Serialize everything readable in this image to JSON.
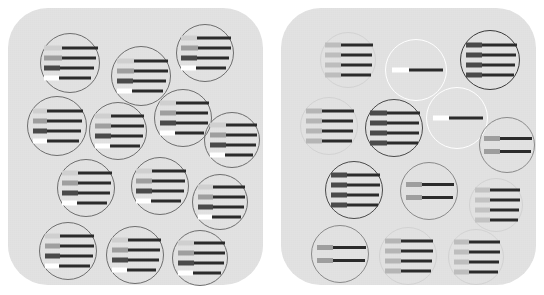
{
  "figure": {
    "background_color": "#ffffff",
    "panel_color": "#e2e2e2",
    "panel_corner_radius_px": 40
  },
  "palette": {
    "light_gray": "#cfcfcf",
    "mid_gray": "#9e9e9e",
    "dark_gray": "#4a4a4a",
    "white": "#ffffff",
    "bar_dark": "#2b2b2b",
    "circle_stroke_default": "#6e6e6e",
    "circle_stroke_white": "#ffffff"
  },
  "panels": [
    {
      "id": "panel-left",
      "name": "left-panel",
      "label": "",
      "cells": [
        {
          "id": "L1",
          "cx": 62,
          "cy": 55,
          "r": 30,
          "stroke": "#6e6e6e",
          "stroke_w": 1.1,
          "opacity": 1,
          "bars": [
            {
              "left": "#cfcfcf",
              "lw": 18,
              "rw": 36
            },
            {
              "left": "#9e9e9e",
              "lw": 18,
              "rw": 34
            },
            {
              "left": "#4a4a4a",
              "lw": 16,
              "rw": 34
            },
            {
              "left": "#ffffff",
              "lw": 15,
              "rw": 32
            }
          ]
        },
        {
          "id": "L2",
          "cx": 133,
          "cy": 68,
          "r": 30,
          "stroke": "#6e6e6e",
          "stroke_w": 1.1,
          "opacity": 1,
          "bars": [
            {
              "left": "#cfcfcf",
              "lw": 17,
              "rw": 34
            },
            {
              "left": "#9e9e9e",
              "lw": 17,
              "rw": 34
            },
            {
              "left": "#4a4a4a",
              "lw": 16,
              "rw": 33
            },
            {
              "left": "#ffffff",
              "lw": 15,
              "rw": 31
            }
          ]
        },
        {
          "id": "L3",
          "cx": 197,
          "cy": 45,
          "r": 29,
          "stroke": "#6e6e6e",
          "stroke_w": 1.1,
          "opacity": 1,
          "bars": [
            {
              "left": "#cfcfcf",
              "lw": 16,
              "rw": 34
            },
            {
              "left": "#9e9e9e",
              "lw": 17,
              "rw": 33
            },
            {
              "left": "#4a4a4a",
              "lw": 16,
              "rw": 32
            },
            {
              "left": "#ffffff",
              "lw": 15,
              "rw": 30
            }
          ]
        },
        {
          "id": "L4",
          "cx": 49,
          "cy": 118,
          "r": 30,
          "stroke": "#6e6e6e",
          "stroke_w": 1.1,
          "opacity": 1,
          "bars": [
            {
              "left": "#cfcfcf",
              "lw": 14,
              "rw": 36
            },
            {
              "left": "#9e9e9e",
              "lw": 14,
              "rw": 35
            },
            {
              "left": "#4a4a4a",
              "lw": 14,
              "rw": 34
            },
            {
              "left": "#ffffff",
              "lw": 14,
              "rw": 32
            }
          ]
        },
        {
          "id": "L5",
          "cx": 110,
          "cy": 123,
          "r": 29,
          "stroke": "#6e6e6e",
          "stroke_w": 1.1,
          "opacity": 1,
          "bars": [
            {
              "left": "#cfcfcf",
              "lw": 16,
              "rw": 33
            },
            {
              "left": "#9e9e9e",
              "lw": 16,
              "rw": 33
            },
            {
              "left": "#4a4a4a",
              "lw": 16,
              "rw": 32
            },
            {
              "left": "#ffffff",
              "lw": 15,
              "rw": 30
            }
          ]
        },
        {
          "id": "L6",
          "cx": 175,
          "cy": 110,
          "r": 29,
          "stroke": "#6e6e6e",
          "stroke_w": 1.1,
          "opacity": 1,
          "bars": [
            {
              "left": "#cfcfcf",
              "lw": 16,
              "rw": 33
            },
            {
              "left": "#9e9e9e",
              "lw": 16,
              "rw": 32
            },
            {
              "left": "#4a4a4a",
              "lw": 16,
              "rw": 32
            },
            {
              "left": "#ffffff",
              "lw": 15,
              "rw": 29
            }
          ]
        },
        {
          "id": "L7",
          "cx": 224,
          "cy": 132,
          "r": 28,
          "stroke": "#6e6e6e",
          "stroke_w": 1.1,
          "opacity": 1,
          "bars": [
            {
              "left": "#cfcfcf",
              "lw": 16,
              "rw": 31
            },
            {
              "left": "#9e9e9e",
              "lw": 16,
              "rw": 31
            },
            {
              "left": "#4a4a4a",
              "lw": 16,
              "rw": 30
            },
            {
              "left": "#ffffff",
              "lw": 15,
              "rw": 28
            }
          ]
        },
        {
          "id": "L8",
          "cx": 78,
          "cy": 180,
          "r": 29,
          "stroke": "#6e6e6e",
          "stroke_w": 1.1,
          "opacity": 1,
          "bars": [
            {
              "left": "#cfcfcf",
              "lw": 16,
              "rw": 34
            },
            {
              "left": "#9e9e9e",
              "lw": 16,
              "rw": 33
            },
            {
              "left": "#4a4a4a",
              "lw": 16,
              "rw": 32
            },
            {
              "left": "#ffffff",
              "lw": 15,
              "rw": 30
            }
          ]
        },
        {
          "id": "L9",
          "cx": 152,
          "cy": 178,
          "r": 29,
          "stroke": "#6e6e6e",
          "stroke_w": 1.1,
          "opacity": 1,
          "bars": [
            {
              "left": "#cfcfcf",
              "lw": 16,
              "rw": 34
            },
            {
              "left": "#9e9e9e",
              "lw": 16,
              "rw": 33
            },
            {
              "left": "#4a4a4a",
              "lw": 16,
              "rw": 32
            },
            {
              "left": "#ffffff",
              "lw": 15,
              "rw": 30
            }
          ]
        },
        {
          "id": "L10",
          "cx": 212,
          "cy": 194,
          "r": 28,
          "stroke": "#6e6e6e",
          "stroke_w": 1.1,
          "opacity": 1,
          "bars": [
            {
              "left": "#cfcfcf",
              "lw": 15,
              "rw": 32
            },
            {
              "left": "#9e9e9e",
              "lw": 15,
              "rw": 32
            },
            {
              "left": "#4a4a4a",
              "lw": 15,
              "rw": 31
            },
            {
              "left": "#ffffff",
              "lw": 14,
              "rw": 29
            }
          ]
        },
        {
          "id": "L11",
          "cx": 60,
          "cy": 243,
          "r": 29,
          "stroke": "#6e6e6e",
          "stroke_w": 1.1,
          "opacity": 1,
          "bars": [
            {
              "left": "#cfcfcf",
              "lw": 15,
              "rw": 34
            },
            {
              "left": "#9e9e9e",
              "lw": 15,
              "rw": 34
            },
            {
              "left": "#4a4a4a",
              "lw": 15,
              "rw": 33
            },
            {
              "left": "#ffffff",
              "lw": 14,
              "rw": 31
            }
          ]
        },
        {
          "id": "L12",
          "cx": 127,
          "cy": 247,
          "r": 29,
          "stroke": "#6e6e6e",
          "stroke_w": 1.1,
          "opacity": 1,
          "bars": [
            {
              "left": "#cfcfcf",
              "lw": 16,
              "rw": 33
            },
            {
              "left": "#9e9e9e",
              "lw": 16,
              "rw": 32
            },
            {
              "left": "#4a4a4a",
              "lw": 16,
              "rw": 31
            },
            {
              "left": "#ffffff",
              "lw": 15,
              "rw": 29
            }
          ]
        },
        {
          "id": "L13",
          "cx": 192,
          "cy": 250,
          "r": 28,
          "stroke": "#6e6e6e",
          "stroke_w": 1.1,
          "opacity": 1,
          "bars": [
            {
              "left": "#cfcfcf",
              "lw": 16,
              "rw": 31
            },
            {
              "left": "#9e9e9e",
              "lw": 16,
              "rw": 31
            },
            {
              "left": "#4a4a4a",
              "lw": 16,
              "rw": 30
            },
            {
              "left": "#ffffff",
              "lw": 15,
              "rw": 28
            }
          ]
        }
      ]
    },
    {
      "id": "panel-right",
      "name": "right-panel",
      "label": "",
      "cells": [
        {
          "id": "R1",
          "cx": 67,
          "cy": 52,
          "r": 28,
          "stroke": "#d2d2d2",
          "stroke_w": 1.0,
          "opacity": 1,
          "bars": [
            {
              "left": "#bdbdbd",
              "lw": 16,
              "rw": 32
            },
            {
              "left": "#bdbdbd",
              "lw": 16,
              "rw": 31
            },
            {
              "left": "#bdbdbd",
              "lw": 16,
              "rw": 31
            },
            {
              "left": "#bdbdbd",
              "lw": 16,
              "rw": 30
            }
          ]
        },
        {
          "id": "R2",
          "cx": 135,
          "cy": 62,
          "r": 31,
          "stroke": "#ffffff",
          "stroke_w": 1.6,
          "opacity": 1,
          "bars": [
            {
              "left": "#ffffff",
              "lw": 17,
              "rw": 34
            }
          ]
        },
        {
          "id": "R3",
          "cx": 209,
          "cy": 52,
          "r": 30,
          "stroke": "#3a3a3a",
          "stroke_w": 1.6,
          "opacity": 1,
          "bars": [
            {
              "left": "#4a4a4a",
              "lw": 16,
              "rw": 35
            },
            {
              "left": "#4a4a4a",
              "lw": 16,
              "rw": 34
            },
            {
              "left": "#4a4a4a",
              "lw": 16,
              "rw": 33
            },
            {
              "left": "#4a4a4a",
              "lw": 16,
              "rw": 32
            }
          ]
        },
        {
          "id": "R4",
          "cx": 48,
          "cy": 118,
          "r": 29,
          "stroke": "#d2d2d2",
          "stroke_w": 1.0,
          "opacity": 1,
          "bars": [
            {
              "left": "#b5b5b5",
              "lw": 16,
              "rw": 32
            },
            {
              "left": "#b5b5b5",
              "lw": 16,
              "rw": 31
            },
            {
              "left": "#b5b5b5",
              "lw": 16,
              "rw": 31
            },
            {
              "left": "#b5b5b5",
              "lw": 16,
              "rw": 30
            }
          ]
        },
        {
          "id": "R5",
          "cx": 113,
          "cy": 120,
          "r": 29,
          "stroke": "#4a4a4a",
          "stroke_w": 1.5,
          "opacity": 1,
          "bars": [
            {
              "left": "#4a4a4a",
              "lw": 17,
              "rw": 33
            },
            {
              "left": "#4a4a4a",
              "lw": 17,
              "rw": 32
            },
            {
              "left": "#4a4a4a",
              "lw": 17,
              "rw": 32
            },
            {
              "left": "#4a4a4a",
              "lw": 17,
              "rw": 31
            }
          ]
        },
        {
          "id": "R6",
          "cx": 176,
          "cy": 110,
          "r": 31,
          "stroke": "#ffffff",
          "stroke_w": 1.6,
          "opacity": 1,
          "bars": [
            {
              "left": "#ffffff",
              "lw": 16,
              "rw": 34
            }
          ]
        },
        {
          "id": "R7",
          "cx": 226,
          "cy": 137,
          "r": 28,
          "stroke": "#8a8a8a",
          "stroke_w": 1.2,
          "opacity": 1,
          "bars": [
            {
              "left": "#9e9e9e",
              "lw": 16,
              "rw": 32
            },
            {
              "left": "#9e9e9e",
              "lw": 16,
              "rw": 31
            }
          ]
        },
        {
          "id": "R8",
          "cx": 73,
          "cy": 182,
          "r": 29,
          "stroke": "#4a4a4a",
          "stroke_w": 1.5,
          "opacity": 1,
          "bars": [
            {
              "left": "#4a4a4a",
              "lw": 16,
              "rw": 33
            },
            {
              "left": "#4a4a4a",
              "lw": 16,
              "rw": 33
            },
            {
              "left": "#4a4a4a",
              "lw": 16,
              "rw": 32
            },
            {
              "left": "#4a4a4a",
              "lw": 16,
              "rw": 31
            }
          ]
        },
        {
          "id": "R9",
          "cx": 148,
          "cy": 183,
          "r": 29,
          "stroke": "#8a8a8a",
          "stroke_w": 1.2,
          "opacity": 1,
          "bars": [
            {
              "left": "#9e9e9e",
              "lw": 16,
              "rw": 32
            },
            {
              "left": "#9e9e9e",
              "lw": 16,
              "rw": 31
            }
          ]
        },
        {
          "id": "R10",
          "cx": 215,
          "cy": 197,
          "r": 27,
          "stroke": "#d2d2d2",
          "stroke_w": 1.0,
          "opacity": 1,
          "bars": [
            {
              "left": "#c2c2c2",
              "lw": 15,
              "rw": 30
            },
            {
              "left": "#c2c2c2",
              "lw": 15,
              "rw": 30
            },
            {
              "left": "#c2c2c2",
              "lw": 15,
              "rw": 29
            },
            {
              "left": "#c2c2c2",
              "lw": 15,
              "rw": 28
            }
          ]
        },
        {
          "id": "R11",
          "cx": 59,
          "cy": 246,
          "r": 29,
          "stroke": "#8a8a8a",
          "stroke_w": 1.2,
          "opacity": 1,
          "bars": [
            {
              "left": "#9e9e9e",
              "lw": 16,
              "rw": 33
            },
            {
              "left": "#9e9e9e",
              "lw": 16,
              "rw": 32
            }
          ]
        },
        {
          "id": "R12",
          "cx": 127,
          "cy": 248,
          "r": 29,
          "stroke": "#d2d2d2",
          "stroke_w": 1.0,
          "opacity": 1,
          "bars": [
            {
              "left": "#b5b5b5",
              "lw": 16,
              "rw": 32
            },
            {
              "left": "#b5b5b5",
              "lw": 16,
              "rw": 32
            },
            {
              "left": "#b5b5b5",
              "lw": 16,
              "rw": 31
            },
            {
              "left": "#b5b5b5",
              "lw": 16,
              "rw": 30
            }
          ]
        },
        {
          "id": "R13",
          "cx": 195,
          "cy": 249,
          "r": 28,
          "stroke": "#d2d2d2",
          "stroke_w": 1.0,
          "opacity": 1,
          "bars": [
            {
              "left": "#bdbdbd",
              "lw": 15,
              "rw": 31
            },
            {
              "left": "#bdbdbd",
              "lw": 15,
              "rw": 31
            },
            {
              "left": "#bdbdbd",
              "lw": 15,
              "rw": 30
            },
            {
              "left": "#bdbdbd",
              "lw": 15,
              "rw": 29
            }
          ]
        }
      ]
    }
  ]
}
